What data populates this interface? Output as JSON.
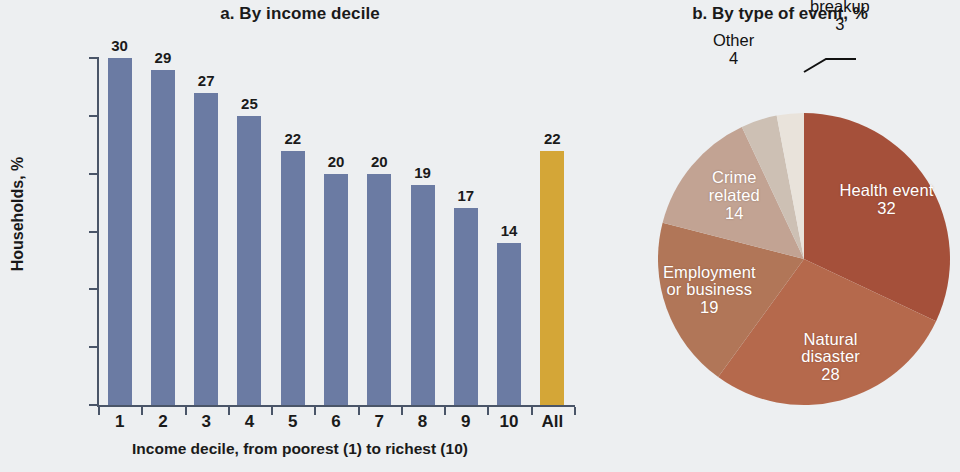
{
  "chart_data": [
    {
      "type": "bar",
      "panel": "a",
      "title": "a. By income decile",
      "xlabel": "Income decile, from poorest (1) to richest (10)",
      "ylabel": "Households, %",
      "categories": [
        "1",
        "2",
        "3",
        "4",
        "5",
        "6",
        "7",
        "8",
        "9",
        "10",
        "All"
      ],
      "values": [
        30,
        29,
        27,
        25,
        22,
        20,
        20,
        19,
        17,
        14,
        22
      ],
      "value_labels": [
        "30",
        "29",
        "27",
        "25",
        "22",
        "20",
        "20",
        "19",
        "17",
        "14",
        "22"
      ],
      "ylim": [
        0,
        30
      ],
      "yticks": [
        "0",
        "5",
        "10",
        "15",
        "20",
        "25",
        "30"
      ],
      "ytick_values": [
        0,
        5,
        10,
        15,
        20,
        25,
        30
      ],
      "grid": false,
      "legend": "none",
      "bar_color": "#6b7ba3",
      "highlight_bar_color": "#d4a637",
      "highlight_category": "All"
    },
    {
      "type": "pie",
      "panel": "b",
      "title": "b. By type of event, %",
      "start_angle_deg": 0,
      "direction": "clockwise",
      "labels": [
        "Health event",
        "Natural disaster",
        "Employment or business",
        "Crime related",
        "Other",
        "Household breakup"
      ],
      "values": [
        32,
        28,
        19,
        14,
        4,
        3
      ],
      "value_labels": [
        "32",
        "28",
        "19",
        "14",
        "4",
        "3"
      ],
      "colors": [
        "#a5503a",
        "#b5694c",
        "#b17658",
        "#c2a393",
        "#cdc0b4",
        "#e9e3db"
      ],
      "label_placement": [
        "inside",
        "inside",
        "inside",
        "inside",
        "outside",
        "outside-leader"
      ],
      "slice_label_lines": [
        [
          "Health event"
        ],
        [
          "Natural",
          "disaster"
        ],
        [
          "Employment",
          "or business"
        ],
        [
          "Crime",
          "related"
        ],
        [
          "Other"
        ],
        [
          "Household",
          "breakup"
        ]
      ]
    }
  ],
  "panel_a": {
    "title": "a. By income decile",
    "ylabel": "Households, %",
    "xcaption": "Income decile, from poorest (1) to richest (10)"
  },
  "panel_b": {
    "title": "b. By type of event, %"
  },
  "colors": {
    "background": "#edeff1",
    "bar": "#6b7ba3",
    "bar_highlight": "#d4a637",
    "axis": "#4a5568",
    "text": "#1a1a1a"
  }
}
